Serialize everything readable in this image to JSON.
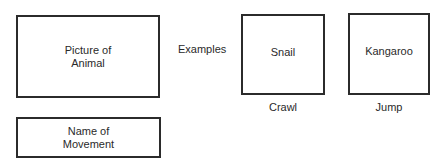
{
  "template": {
    "picture_box": "Picture of\nAnimal",
    "name_box": "Name of\nMovement"
  },
  "examples_label": "Examples",
  "examples": [
    {
      "animal": "Snail",
      "movement": "Crawl"
    },
    {
      "animal": "Kangaroo",
      "movement": "Jump"
    }
  ]
}
